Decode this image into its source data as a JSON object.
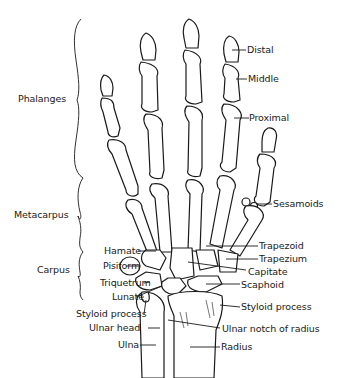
{
  "figure": {
    "background": "#ffffff",
    "ink": "#1a1a1a"
  },
  "groups": [
    {
      "id": "phalanges",
      "label": "Phalanges"
    },
    {
      "id": "metacarpus",
      "label": "Metacarpus"
    },
    {
      "id": "carpus",
      "label": "Carpus"
    }
  ],
  "labels": {
    "distal": "Distal",
    "middle": "Middle",
    "proximal": "Proximal",
    "sesamoids": "Sesamoids",
    "trapezoid": "Trapezoid",
    "trapezium": "Trapezium",
    "capitate": "Capitate",
    "scaphoid": "Scaphoid",
    "styloid_radius": "Styloid process",
    "ulnar_notch": "Ulnar notch of radius",
    "radius": "Radius",
    "hamate": "Hamate",
    "pisiform": "Pisiform",
    "triquetrum": "Triquetrum",
    "lunate": "Lunate",
    "styloid_ulna": "Styloid process",
    "ulnar_head": "Ulnar head",
    "ulna": "Ulna"
  }
}
